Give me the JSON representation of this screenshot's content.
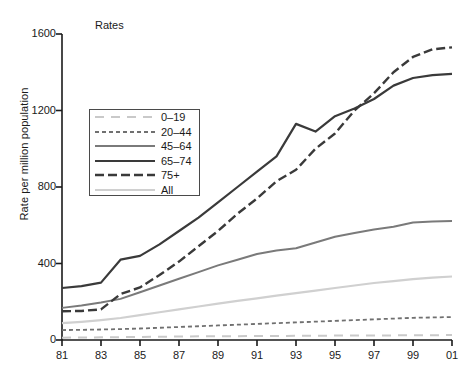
{
  "chart_data": {
    "type": "line",
    "title": "Rates",
    "xlabel": "",
    "ylabel": "Rate per million population",
    "xlim": [
      81,
      101
    ],
    "ylim": [
      0,
      1600
    ],
    "grid": false,
    "legend_position": "upper-left-inside",
    "x": [
      81,
      82,
      83,
      84,
      85,
      86,
      87,
      88,
      89,
      90,
      91,
      92,
      93,
      94,
      95,
      96,
      97,
      98,
      99,
      100,
      101
    ],
    "x_tick_labels": [
      "81",
      "83",
      "85",
      "87",
      "89",
      "91",
      "93",
      "95",
      "97",
      "99",
      "01"
    ],
    "x_tick_values": [
      81,
      83,
      85,
      87,
      89,
      91,
      93,
      95,
      97,
      99,
      101
    ],
    "y_tick_labels": [
      "0",
      "400",
      "800",
      "1200",
      "1600"
    ],
    "y_tick_values": [
      0,
      400,
      800,
      1200,
      1600
    ],
    "series": [
      {
        "name": "0–19",
        "style": "long-dash",
        "color": "#c9c9c9",
        "values": [
          12,
          13,
          14,
          15,
          16,
          17,
          18,
          19,
          20,
          20,
          21,
          21,
          22,
          22,
          23,
          23,
          24,
          24,
          25,
          25,
          26
        ]
      },
      {
        "name": "20–44",
        "style": "short-dash",
        "color": "#707070",
        "values": [
          52,
          53,
          55,
          57,
          60,
          64,
          68,
          72,
          76,
          80,
          84,
          88,
          92,
          96,
          100,
          104,
          108,
          112,
          116,
          118,
          120
        ]
      },
      {
        "name": "45–64",
        "style": "solid",
        "color": "#7a7a7a",
        "values": [
          168,
          180,
          196,
          215,
          250,
          285,
          320,
          355,
          390,
          420,
          450,
          468,
          480,
          510,
          540,
          560,
          578,
          592,
          614,
          620,
          622
        ]
      },
      {
        "name": "65–74",
        "style": "solid",
        "color": "#3a3a3a",
        "values": [
          272,
          282,
          300,
          420,
          440,
          500,
          570,
          640,
          720,
          800,
          880,
          960,
          1130,
          1090,
          1170,
          1210,
          1260,
          1330,
          1370,
          1385,
          1392
        ]
      },
      {
        "name": "75+",
        "style": "dash-dot-long",
        "color": "#3a3a3a",
        "values": [
          150,
          152,
          160,
          240,
          275,
          340,
          410,
          490,
          570,
          660,
          740,
          830,
          890,
          1000,
          1080,
          1200,
          1290,
          1400,
          1480,
          1520,
          1530
        ]
      },
      {
        "name": "All",
        "style": "solid",
        "color": "#d0d0d0",
        "values": [
          88,
          95,
          104,
          115,
          130,
          145,
          160,
          175,
          190,
          205,
          218,
          232,
          245,
          258,
          272,
          285,
          298,
          308,
          318,
          326,
          332
        ]
      }
    ]
  },
  "colors": {
    "axis": "#1a1a1a",
    "background": "#ffffff",
    "legend_border": "#4a4a4a"
  }
}
